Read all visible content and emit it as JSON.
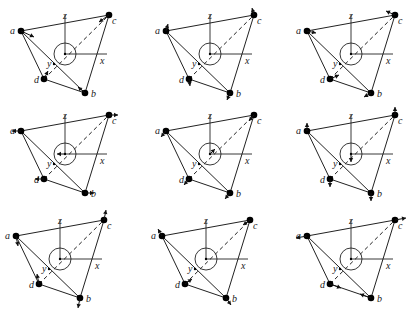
{
  "figure": {
    "geometry": {
      "a": [
        21,
        31
      ],
      "b": [
        85,
        93
      ],
      "c": [
        109,
        15
      ],
      "d": [
        44,
        79
      ],
      "center": [
        65,
        54
      ],
      "circle_r": 11,
      "z_axis_top": [
        65,
        15
      ],
      "x_axis_end": [
        107,
        54
      ],
      "y_point": [
        54,
        64
      ]
    },
    "labels": {
      "a": "a",
      "b": "b",
      "c": "c",
      "d": "d",
      "x": "x",
      "y": "y",
      "z": "z"
    },
    "panels": [
      {
        "id": 1,
        "offset": [
          0,
          0
        ],
        "arrows": [
          [
            [
              21,
              31
            ],
            [
              34,
              37
            ]
          ],
          [
            [
              109,
              15
            ],
            [
              99,
              22
            ]
          ],
          [
            [
              85,
              93
            ],
            [
              78,
              87
            ]
          ],
          [
            [
              44,
              79
            ],
            [
              48,
              71
            ]
          ]
        ]
      },
      {
        "id": 2,
        "offset": [
          145,
          0
        ],
        "arrows": [
          [
            [
              21,
              31
            ],
            [
              23,
              24
            ]
          ],
          [
            [
              109,
              15
            ],
            [
              107,
              8
            ]
          ],
          [
            [
              85,
              93
            ],
            [
              82,
              100
            ]
          ],
          [
            [
              44,
              79
            ],
            [
              45,
              86
            ]
          ]
        ]
      },
      {
        "id": 3,
        "offset": [
          286,
          0
        ],
        "arrows": [
          [
            [
              21,
              31
            ],
            [
              30,
              33
            ]
          ],
          [
            [
              109,
              15
            ],
            [
              100,
              11
            ]
          ],
          [
            [
              85,
              93
            ],
            [
              78,
              97
            ]
          ],
          [
            [
              44,
              79
            ],
            [
              53,
              75
            ]
          ]
        ]
      },
      {
        "id": 4,
        "offset": [
          0,
          100
        ],
        "arrows": [
          [
            [
              21,
              31
            ],
            [
              12,
              31
            ]
          ],
          [
            [
              109,
              15
            ],
            [
              118,
              15
            ]
          ],
          [
            [
              85,
              93
            ],
            [
              94,
              93
            ]
          ],
          [
            [
              44,
              79
            ],
            [
              35,
              79
            ]
          ],
          [
            [
              65,
              54
            ],
            [
              57,
              54
            ]
          ]
        ]
      },
      {
        "id": 5,
        "offset": [
          145,
          100
        ],
        "arrows": [
          [
            [
              21,
              31
            ],
            [
              16,
              37
            ]
          ],
          [
            [
              109,
              15
            ],
            [
              104,
              21
            ]
          ],
          [
            [
              85,
              93
            ],
            [
              80,
              99
            ]
          ],
          [
            [
              44,
              79
            ],
            [
              39,
              85
            ]
          ],
          [
            [
              65,
              54
            ],
            [
              70,
              49
            ]
          ]
        ]
      },
      {
        "id": 6,
        "offset": [
          286,
          100
        ],
        "arrows": [
          [
            [
              21,
              31
            ],
            [
              21,
              23
            ]
          ],
          [
            [
              109,
              15
            ],
            [
              109,
              7
            ]
          ],
          [
            [
              85,
              93
            ],
            [
              85,
              101
            ]
          ],
          [
            [
              44,
              79
            ],
            [
              44,
              87
            ]
          ],
          [
            [
              65,
              54
            ],
            [
              65,
              62
            ]
          ]
        ]
      },
      {
        "id": 7,
        "offset": [
          -5,
          205
        ],
        "arrows": [
          [
            [
              21,
              31
            ],
            [
              23,
              41
            ]
          ],
          [
            [
              109,
              15
            ],
            [
              111,
              5
            ]
          ],
          [
            [
              85,
              93
            ],
            [
              83,
              103
            ]
          ],
          [
            [
              44,
              79
            ],
            [
              42,
              69
            ]
          ]
        ]
      },
      {
        "id": 8,
        "offset": [
          141,
          205
        ],
        "arrows": [
          [
            [
              21,
              31
            ],
            [
              17,
              24
            ]
          ],
          [
            [
              109,
              15
            ],
            [
              102,
              20
            ]
          ],
          [
            [
              85,
              93
            ],
            [
              90,
              100
            ]
          ],
          [
            [
              44,
              79
            ],
            [
              51,
              74
            ]
          ]
        ]
      },
      {
        "id": 9,
        "offset": [
          286,
          205
        ],
        "arrows": [
          [
            [
              21,
              31
            ],
            [
              10,
              33
            ]
          ],
          [
            [
              109,
              15
            ],
            [
              120,
              13
            ]
          ],
          [
            [
              85,
              93
            ],
            [
              74,
              89
            ]
          ],
          [
            [
              44,
              79
            ],
            [
              55,
              83
            ]
          ]
        ]
      }
    ]
  }
}
